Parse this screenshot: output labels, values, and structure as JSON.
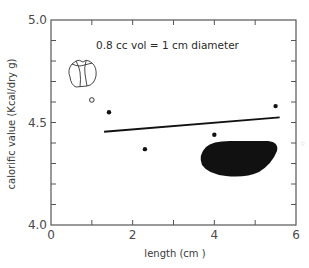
{
  "chart_data": {
    "type": "scatter",
    "title": "",
    "xlabel": "length  (cm )",
    "ylabel": "calorific value  (Kcal/dry  g)",
    "xlim": [
      0,
      6
    ],
    "ylim": [
      4.0,
      5.0
    ],
    "x_ticks": [
      0,
      1,
      2,
      3,
      4,
      5,
      6
    ],
    "x_tick_labels": [
      "0",
      "",
      "2",
      "",
      "4",
      "",
      "6"
    ],
    "y_ticks": [
      4.0,
      4.1,
      4.2,
      4.3,
      4.4,
      4.5,
      4.6,
      4.7,
      4.8,
      4.9,
      5.0
    ],
    "y_tick_labels": [
      "4.0",
      "",
      "",
      "",
      "",
      "4.5",
      "",
      "",
      "",
      "",
      "5.0"
    ],
    "grid": false,
    "legend": null,
    "series": [
      {
        "name": "filled points",
        "marker": "filled-circle",
        "points": [
          {
            "x": 1.42,
            "y": 4.55
          },
          {
            "x": 2.3,
            "y": 4.37
          },
          {
            "x": 4.0,
            "y": 4.44
          },
          {
            "x": 5.5,
            "y": 4.58
          }
        ]
      },
      {
        "name": "open point",
        "marker": "open-circle",
        "points": [
          {
            "x": 1.0,
            "y": 4.61
          }
        ]
      },
      {
        "name": "regression line",
        "type": "line",
        "points": [
          {
            "x": 1.3,
            "y": 4.455
          },
          {
            "x": 5.6,
            "y": 4.525
          }
        ]
      }
    ],
    "annotations": [
      {
        "text": "0.8 cc  vol  = 1 cm  diameter",
        "x": 1.8,
        "y": 4.88
      },
      {
        "text": "seed-drawing (small, upper left)",
        "kind": "illustration",
        "x": 0.6,
        "y": 4.72
      },
      {
        "text": "seed-silhouette (large black, lower right)",
        "kind": "illustration",
        "x": 4.5,
        "y": 4.35
      }
    ]
  }
}
